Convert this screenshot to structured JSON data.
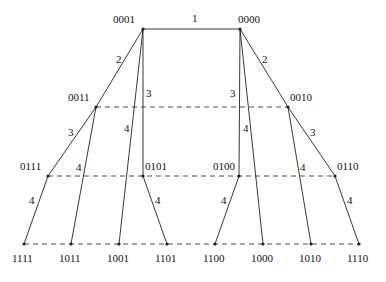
{
  "diagram": {
    "type": "binary-tree-hypercube",
    "levels_y": [
      29,
      107,
      176,
      244
    ],
    "nodes": [
      {
        "id": "0001",
        "x": 143,
        "y": 29,
        "label_dx": -30,
        "label_dy": -6
      },
      {
        "id": "0000",
        "x": 240,
        "y": 29,
        "label_dx": -2,
        "label_dy": -6
      },
      {
        "id": "0011",
        "x": 96,
        "y": 107,
        "label_dx": -28,
        "label_dy": -6
      },
      {
        "id": "0010",
        "x": 288,
        "y": 107,
        "label_dx": 2,
        "label_dy": -6
      },
      {
        "id": "0111",
        "x": 48,
        "y": 176,
        "label_dx": -28,
        "label_dy": -6
      },
      {
        "id": "0101",
        "x": 143,
        "y": 176,
        "label_dx": 2,
        "label_dy": -6
      },
      {
        "id": "0100",
        "x": 239,
        "y": 176,
        "label_dx": -26,
        "label_dy": -6
      },
      {
        "id": "0110",
        "x": 335,
        "y": 176,
        "label_dx": 2,
        "label_dy": -6
      },
      {
        "id": "1111",
        "x": 24,
        "y": 244,
        "label_dx": -12,
        "label_dy": 18
      },
      {
        "id": "1011",
        "x": 71,
        "y": 244,
        "label_dx": -12,
        "label_dy": 18
      },
      {
        "id": "1001",
        "x": 119,
        "y": 244,
        "label_dx": -12,
        "label_dy": 18
      },
      {
        "id": "1101",
        "x": 167,
        "y": 244,
        "label_dx": -12,
        "label_dy": 18
      },
      {
        "id": "1100",
        "x": 215,
        "y": 244,
        "label_dx": -12,
        "label_dy": 18
      },
      {
        "id": "1000",
        "x": 263,
        "y": 244,
        "label_dx": -12,
        "label_dy": 18
      },
      {
        "id": "1010",
        "x": 311,
        "y": 244,
        "label_dx": -12,
        "label_dy": 18
      },
      {
        "id": "1110",
        "x": 359,
        "y": 244,
        "label_dx": -12,
        "label_dy": 18
      }
    ],
    "edges": [
      {
        "from": "0001",
        "to": "0000",
        "label": "1",
        "lx": 192,
        "ly": 22
      },
      {
        "from": "0001",
        "to": "0011",
        "label": "2",
        "lx": 116,
        "ly": 63
      },
      {
        "from": "0000",
        "to": "0010",
        "label": "2",
        "lx": 262,
        "ly": 63
      },
      {
        "from": "0001",
        "to": "0101",
        "label": "3",
        "lx": 146,
        "ly": 97
      },
      {
        "from": "0000",
        "to": "0100",
        "label": "3",
        "lx": 230,
        "ly": 97
      },
      {
        "from": "0011",
        "to": "0111",
        "label": "3",
        "lx": 68,
        "ly": 136
      },
      {
        "from": "0010",
        "to": "0110",
        "label": "3",
        "lx": 310,
        "ly": 136
      },
      {
        "from": "0001",
        "to": "1001",
        "label": "4",
        "lx": 124,
        "ly": 132
      },
      {
        "from": "0000",
        "to": "1000",
        "label": "4",
        "lx": 243,
        "ly": 132
      },
      {
        "from": "0011",
        "to": "1011",
        "label": "4",
        "lx": 76,
        "ly": 171
      },
      {
        "from": "0010",
        "to": "1010",
        "label": "4",
        "lx": 300,
        "ly": 171
      },
      {
        "from": "0111",
        "to": "1111",
        "label": "4",
        "lx": 29,
        "ly": 204
      },
      {
        "from": "0101",
        "to": "1101",
        "label": "4",
        "lx": 155,
        "ly": 204
      },
      {
        "from": "0100",
        "to": "1100",
        "label": "4",
        "lx": 221,
        "ly": 204
      },
      {
        "from": "0110",
        "to": "1110",
        "label": "4",
        "lx": 347,
        "ly": 204
      }
    ],
    "dashed_rows": [
      {
        "y": 107,
        "x1": 96,
        "x2": 288
      },
      {
        "y": 176,
        "x1": 48,
        "x2": 335
      },
      {
        "y": 244,
        "x1": 24,
        "x2": 359
      }
    ],
    "colors": {
      "line": "#222222",
      "text": "#111111",
      "background": "#ffffff"
    }
  }
}
